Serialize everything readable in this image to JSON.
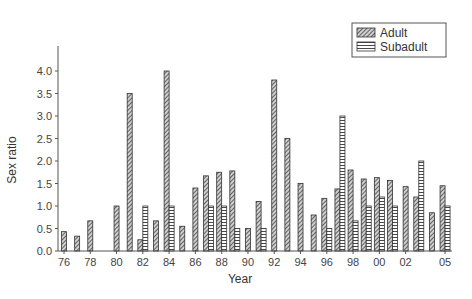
{
  "chart_data": {
    "type": "bar",
    "title": "",
    "xlabel": "Year",
    "ylabel": "Sex ratio",
    "ylim": [
      0,
      4.4
    ],
    "yticks": [
      "0.0",
      "0.5",
      "1.0",
      "1.5",
      "2.0",
      "2.5",
      "3.0",
      "3.5",
      "4.0"
    ],
    "xtick_labels": [
      "76",
      "78",
      "80",
      "82",
      "84",
      "86",
      "88",
      "90",
      "92",
      "94",
      "96",
      "98",
      "00",
      "02",
      "05"
    ],
    "grid": false,
    "legend_position": "top-right",
    "categories": [
      "76",
      "77",
      "78",
      "79",
      "80",
      "81",
      "82",
      "83",
      "84",
      "85",
      "86",
      "87",
      "88",
      "89",
      "90",
      "91",
      "92",
      "93",
      "94",
      "95",
      "96",
      "97",
      "98",
      "99",
      "00",
      "01",
      "02",
      "03",
      "04",
      "05"
    ],
    "series": [
      {
        "name": "Adult",
        "pattern": "diagonal-hatch",
        "values": [
          0.43,
          0.33,
          0.67,
          null,
          1.0,
          3.5,
          0.25,
          0.67,
          4.0,
          0.55,
          1.4,
          1.67,
          1.75,
          1.78,
          0.5,
          1.1,
          3.8,
          2.5,
          1.5,
          0.8,
          1.17,
          1.38,
          1.8,
          1.6,
          1.63,
          1.57,
          1.43,
          1.2,
          0.85,
          1.45
        ]
      },
      {
        "name": "Subadult",
        "pattern": "horizontal-lines",
        "values": [
          null,
          null,
          null,
          null,
          null,
          null,
          1.0,
          null,
          1.0,
          null,
          null,
          1.0,
          1.0,
          0.5,
          null,
          0.5,
          null,
          null,
          null,
          null,
          0.5,
          3.0,
          0.67,
          1.0,
          1.2,
          1.0,
          null,
          2.0,
          null,
          1.0
        ]
      }
    ]
  },
  "legend": {
    "adult": "Adult",
    "subadult": "Subadult"
  },
  "axes": {
    "xlabel": "Year",
    "ylabel": "Sex ratio"
  }
}
